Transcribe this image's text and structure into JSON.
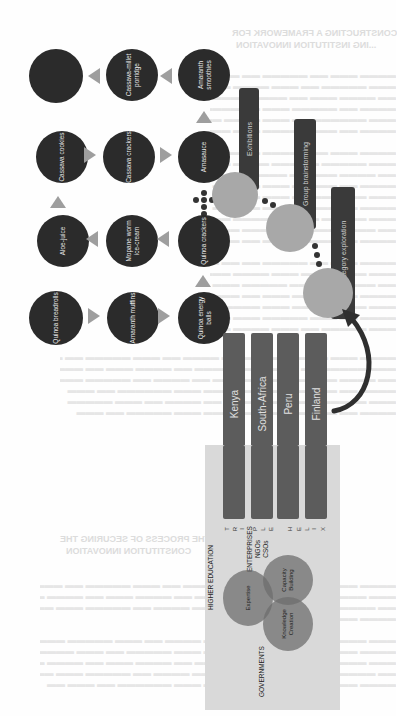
{
  "page": {
    "orientation": "rotated 90 degrees clockwise",
    "bleed_through_headings": [
      "CONSTRUCTING A FRAMEWORK FOR",
      "...ING INSTITUTION INNOVATION",
      "KEY ELEMENTS OF THE PROCESS OF SECURING THE",
      "CONSTITUTION INNOVATION"
    ]
  },
  "diagram": {
    "product_grid": {
      "rows": [
        {
          "name": "top-row",
          "items": [
            "",
            "Cassava-millet porridge",
            "Amaranth smoothies"
          ],
          "arrows": [
            "left",
            "left"
          ]
        },
        {
          "name": "second-row",
          "items": [
            "Cassava cookies",
            "Cassava crackers",
            "Amasauce"
          ],
          "arrows": [
            "right",
            "right"
          ]
        },
        {
          "name": "third-row",
          "items": [
            "Aloe-juice",
            "Mopane worm ice-cream",
            "Quinoa crackers"
          ],
          "arrows": [
            "left",
            "left"
          ]
        },
        {
          "name": "bottom-row",
          "items": [
            "Quinoa breadrolls",
            "Amaranth muffins",
            "Quinoa energy balls"
          ],
          "arrows": [
            "right",
            "right"
          ]
        }
      ],
      "colors": {
        "circle": "#2b2b2b",
        "arrow": "#9e9e9e",
        "label": "#e8e8e8"
      }
    },
    "stages": [
      {
        "label": "Exhibitions"
      },
      {
        "label": "Group brainstorming"
      },
      {
        "label": "Category exploration"
      }
    ],
    "countries": [
      "Kenya",
      "South-Africa",
      "Peru",
      "Finland"
    ],
    "triple_helix": {
      "letters_triple": [
        "T",
        "R",
        "I",
        "P",
        "L",
        "E"
      ],
      "letters_helix": [
        "H",
        "E",
        "L",
        "I",
        "X"
      ],
      "sectors": {
        "higher_education": "HIGHER EDUCATION",
        "enterprises": [
          "ENTERPRISES",
          "NGOs",
          "CSOs"
        ],
        "governments": "GOVERNMENTS"
      },
      "circles": [
        {
          "label_lines": [
            "Expertise"
          ]
        },
        {
          "label_lines": [
            "Capacity",
            "Building"
          ]
        },
        {
          "label_lines": [
            "Knowledge",
            "Creation"
          ]
        }
      ],
      "colors": {
        "box": "#d9d9d9",
        "circle": "#6e6e6e"
      }
    }
  }
}
